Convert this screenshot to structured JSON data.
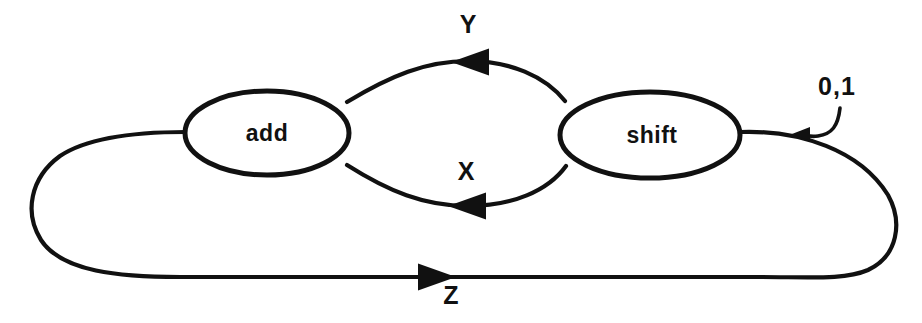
{
  "diagram": {
    "type": "state-machine",
    "background_color": "#ffffff",
    "stroke_color": "#111111",
    "nodes": [
      {
        "id": "add",
        "label": "add",
        "cx": 267,
        "cy": 133,
        "rx": 82,
        "ry": 42
      },
      {
        "id": "shift",
        "label": "shift",
        "cx": 650,
        "cy": 135,
        "rx": 90,
        "ry": 43
      }
    ],
    "edges": [
      {
        "id": "edge-y",
        "label": "Y",
        "from": "shift",
        "to": "add",
        "direction": "right-to-left",
        "position": "upper-middle-arc",
        "label_x": 468,
        "label_y": 26,
        "arrow_x": 468,
        "arrow_y": 62
      },
      {
        "id": "edge-x",
        "label": "X",
        "from": "shift",
        "to": "add",
        "direction": "right-to-left",
        "position": "lower-middle-arc",
        "label_x": 466,
        "label_y": 173,
        "arrow_x": 463,
        "arrow_y": 204
      },
      {
        "id": "edge-z",
        "label": "Z",
        "from": "shift",
        "to": "add",
        "direction": "left-to-right",
        "position": "bottom-outer-loop",
        "label_x": 451,
        "label_y": 297,
        "arrow_x": 442,
        "arrow_y": 277
      }
    ],
    "annotations": [
      {
        "id": "input-symbols",
        "label": "0,1",
        "label_x": 837,
        "label_y": 88,
        "points_to": "edge-z",
        "has_leader_line": true
      }
    ]
  }
}
